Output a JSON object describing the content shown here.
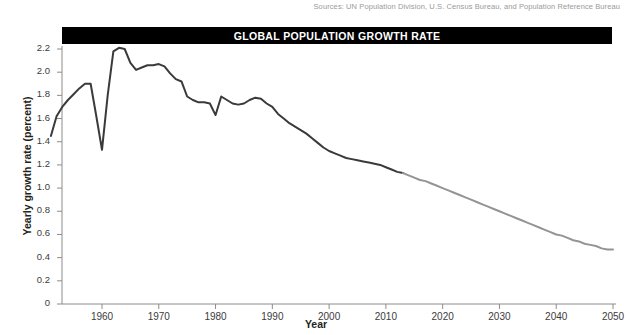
{
  "sources_note": "Sources: UN Population Division, U.S. Census Bureau, and Population Reference Bureau",
  "title": "GLOBAL POPULATION GROWTH RATE",
  "colors": {
    "title_bar_bg": "#000000",
    "title_text": "#ffffff",
    "historical_line": "#3a3a3a",
    "projected_line": "#949494",
    "axis": "#8c8c8c",
    "tick_label": "#3b3b3b",
    "sources_text": "#9a9a9a"
  },
  "chart_data": {
    "type": "line",
    "title": "GLOBAL POPULATION GROWTH RATE",
    "xlabel": "Year",
    "ylabel": "Yearly growth rate (percent)",
    "xlim": [
      1951,
      2050
    ],
    "ylim": [
      0,
      2.3
    ],
    "xticks": [
      1960,
      1970,
      1980,
      1990,
      2000,
      2010,
      2020,
      2030,
      2040,
      2050
    ],
    "xtick_labels": [
      "1960",
      "1970",
      "1980",
      "1990",
      "2000",
      "2010",
      "2020",
      "2030",
      "2040",
      "2050"
    ],
    "yticks": [
      0,
      0.2,
      0.4,
      0.6,
      0.8,
      1.0,
      1.2,
      1.4,
      1.6,
      1.8,
      2.0,
      2.2
    ],
    "ytick_labels": [
      "0",
      "0.2",
      "0.4",
      "0.6",
      "0.8",
      "1.0",
      "1.2",
      "1.4",
      "1.6",
      "1.8",
      "2.0",
      "2.2"
    ],
    "grid": false,
    "legend": null,
    "series": [
      {
        "name": "Historical yearly growth rate",
        "style": "solid",
        "color": "#3a3a3a",
        "x": [
          1951,
          1952,
          1953,
          1954,
          1955,
          1956,
          1957,
          1958,
          1959,
          1960,
          1961,
          1962,
          1963,
          1964,
          1965,
          1966,
          1967,
          1968,
          1969,
          1970,
          1971,
          1972,
          1973,
          1974,
          1975,
          1976,
          1977,
          1978,
          1979,
          1980,
          1981,
          1982,
          1983,
          1984,
          1985,
          1986,
          1987,
          1988,
          1989,
          1990,
          1991,
          1992,
          1993,
          1994,
          1995,
          1996,
          1997,
          1998,
          1999,
          2000,
          2001,
          2002,
          2003,
          2004,
          2005,
          2006,
          2007,
          2008,
          2009,
          2010,
          2011,
          2012,
          2013
        ],
        "y": [
          1.45,
          1.62,
          1.7,
          1.76,
          1.81,
          1.86,
          1.9,
          1.9,
          1.62,
          1.33,
          1.8,
          2.18,
          2.21,
          2.2,
          2.08,
          2.02,
          2.04,
          2.06,
          2.06,
          2.07,
          2.05,
          1.99,
          1.94,
          1.92,
          1.79,
          1.76,
          1.74,
          1.74,
          1.73,
          1.63,
          1.79,
          1.76,
          1.73,
          1.72,
          1.73,
          1.76,
          1.78,
          1.77,
          1.73,
          1.7,
          1.64,
          1.6,
          1.56,
          1.53,
          1.5,
          1.47,
          1.43,
          1.39,
          1.35,
          1.32,
          1.3,
          1.28,
          1.26,
          1.25,
          1.24,
          1.23,
          1.22,
          1.21,
          1.2,
          1.18,
          1.16,
          1.14,
          1.13
        ]
      },
      {
        "name": "Projected yearly growth rate",
        "style": "solid",
        "color": "#949494",
        "x": [
          2013,
          2014,
          2015,
          2016,
          2017,
          2018,
          2019,
          2020,
          2021,
          2022,
          2023,
          2024,
          2025,
          2026,
          2027,
          2028,
          2029,
          2030,
          2031,
          2032,
          2033,
          2034,
          2035,
          2036,
          2037,
          2038,
          2039,
          2040,
          2041,
          2042,
          2043,
          2044,
          2045,
          2046,
          2047,
          2048,
          2049,
          2050
        ],
        "y": [
          1.13,
          1.11,
          1.09,
          1.07,
          1.06,
          1.04,
          1.02,
          1.0,
          0.98,
          0.96,
          0.94,
          0.92,
          0.9,
          0.88,
          0.86,
          0.84,
          0.82,
          0.8,
          0.78,
          0.76,
          0.74,
          0.72,
          0.7,
          0.68,
          0.66,
          0.64,
          0.62,
          0.6,
          0.59,
          0.57,
          0.55,
          0.54,
          0.52,
          0.51,
          0.5,
          0.48,
          0.47,
          0.47
        ]
      }
    ]
  }
}
